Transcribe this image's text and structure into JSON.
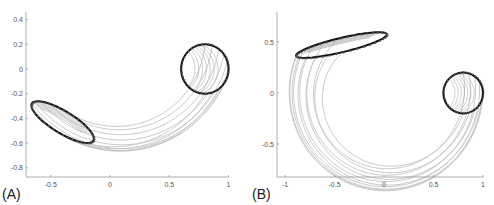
{
  "figure": {
    "width": 494,
    "height": 205,
    "colors": {
      "streamline": "#c4c4c4",
      "contour": "#111111",
      "axis": "#9a9a9a",
      "tick_text": "#555555"
    }
  },
  "chart_data": [
    {
      "type": "line",
      "panel_label": "(A)",
      "title": "",
      "xlabel": "",
      "ylabel": "",
      "xlim": [
        -0.72,
        1.0
      ],
      "ylim": [
        -0.88,
        0.46
      ],
      "xticks": [
        -0.5,
        0,
        0.5,
        1
      ],
      "xtick_labels": [
        "-0.5",
        "0",
        "0.5",
        "1"
      ],
      "yticks": [
        0.4,
        0.2,
        0,
        -0.2,
        -0.4,
        -0.6,
        -0.8
      ],
      "ytick_labels": [
        "0.4",
        "0.2",
        "0",
        "-0.2",
        "-0.4",
        "-0.6",
        "-0.8"
      ],
      "grid": false,
      "legend": null,
      "source_contour": {
        "shape": "circle",
        "center": [
          0.8,
          0.0
        ],
        "radius": 0.2
      },
      "target_contour": {
        "shape": "tilted-ellipse",
        "center": [
          -0.4,
          -0.43
        ],
        "semi_major": 0.3,
        "semi_minor": 0.09,
        "angle_deg": -30
      },
      "streamlines": {
        "count": 11,
        "description": "gray curves transporting the circle to the tilted ellipse along a shallow arc"
      },
      "pixel_map": {
        "x0_px": 110,
        "px_per_x": 118.5,
        "y0_px": 69,
        "px_per_y": 123.5,
        "axis_left_px": 26,
        "axis_bottom_px": 177,
        "axis_right_px": 229,
        "axis_top_px": 12
      }
    },
    {
      "type": "line",
      "panel_label": "(B)",
      "title": "",
      "xlabel": "",
      "ylabel": "",
      "xlim": [
        -1.08,
        1.0
      ],
      "ylim": [
        -0.83,
        0.8
      ],
      "xticks": [
        -1,
        -0.5,
        0,
        0.5,
        1
      ],
      "xtick_labels": [
        "-1",
        "-0.5",
        "0",
        "0.5",
        "1"
      ],
      "yticks": [
        0.5,
        0,
        -0.5
      ],
      "ytick_labels": [
        "0.5",
        "0",
        "-0.5"
      ],
      "grid": false,
      "legend": null,
      "source_contour": {
        "shape": "circle",
        "center": [
          0.8,
          0.0
        ],
        "radius": 0.2
      },
      "target_contour": {
        "shape": "tilted-ellipse",
        "center": [
          -0.43,
          0.47
        ],
        "semi_major": 0.47,
        "semi_minor": 0.07,
        "angle_deg": 13
      },
      "streamlines": {
        "count": 11,
        "description": "gray curves transporting the circle to the ellipse along a large C-shaped arc around the origin"
      },
      "pixel_map": {
        "x0_px": 384,
        "px_per_x": 99,
        "y0_px": 93,
        "px_per_y": 102,
        "axis_left_px": 277,
        "axis_bottom_px": 177,
        "axis_right_px": 483,
        "axis_top_px": 12
      }
    }
  ]
}
